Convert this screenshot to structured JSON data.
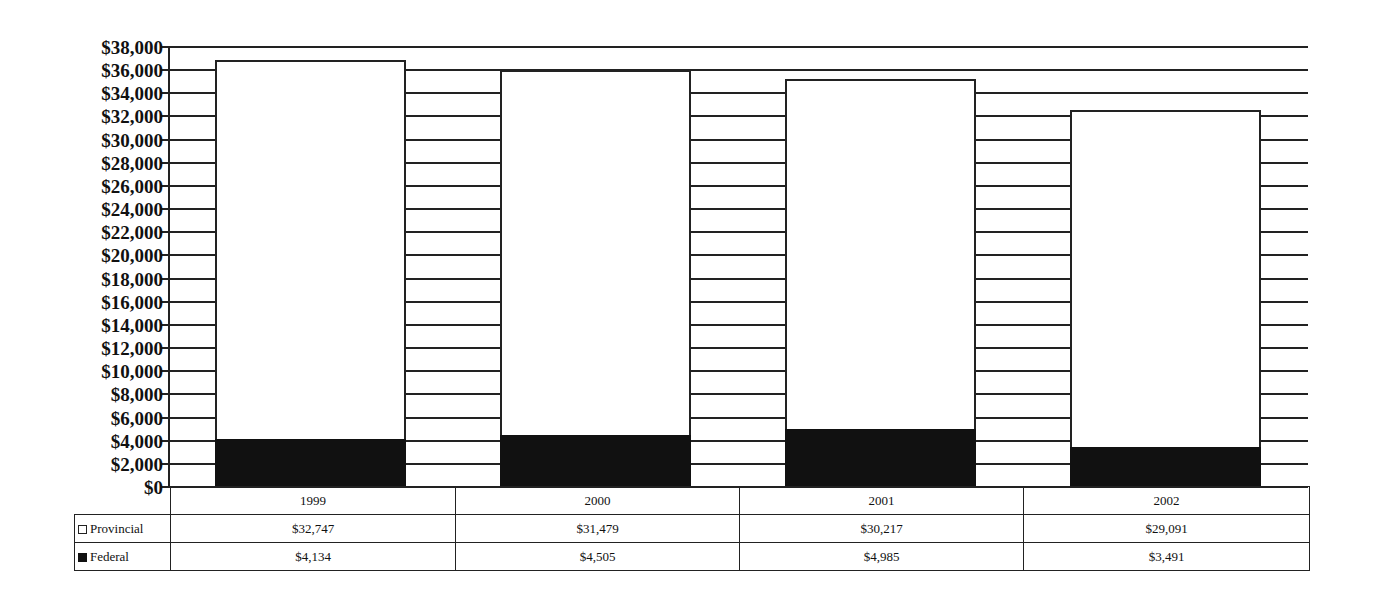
{
  "chart_data": {
    "type": "bar",
    "stacked": true,
    "title": "",
    "xlabel": "",
    "ylabel": "",
    "categories": [
      "1999",
      "2000",
      "2001",
      "2002"
    ],
    "series": [
      {
        "name": "Provincial",
        "color": "#ffffff",
        "values": [
          32747,
          31479,
          30217,
          29091
        ],
        "labels": [
          "$32,747",
          "$31,479",
          "$30,217",
          "$29,091"
        ]
      },
      {
        "name": "Federal",
        "color": "#111111",
        "values": [
          4134,
          4505,
          4985,
          3491
        ],
        "labels": [
          "$4,134",
          "$4,505",
          "$4,985",
          "$3,491"
        ]
      }
    ],
    "ylim": [
      0,
      38000
    ],
    "yticks": [
      "$38,000",
      "$36,000",
      "$34,000",
      "$32,000",
      "$30,000",
      "$28,000",
      "$26,000",
      "$24,000",
      "$22,000",
      "$20,000",
      "$18,000",
      "$16,000",
      "$14,000",
      "$12,000",
      "$10,000",
      "$8,000",
      "$6,000",
      "$4,000",
      "$2,000",
      "$0"
    ],
    "grid": true,
    "legend_position": "data-table-left"
  }
}
